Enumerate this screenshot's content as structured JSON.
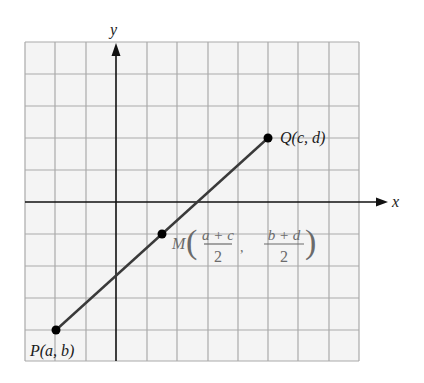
{
  "diagram": {
    "type": "coordinate-plane-midpoint",
    "axes": {
      "x_label": "x",
      "y_label": "y"
    },
    "grid": {
      "columns": 11,
      "rows": 10,
      "line_color": "#a9a9a9",
      "background": "#f4f4f4"
    },
    "colors": {
      "segment": "#3a3a3a",
      "axis": "#111111",
      "point": "#000000",
      "midpoint_label": "#6b6b6b"
    },
    "points": {
      "P": {
        "label": "P(a, b)"
      },
      "Q": {
        "label": "Q(c, d)"
      },
      "M": {
        "name": "M",
        "x_numerator": "a + c",
        "x_denominator": "2",
        "separator": ",",
        "y_numerator": "b + d",
        "y_denominator": "2"
      }
    }
  }
}
